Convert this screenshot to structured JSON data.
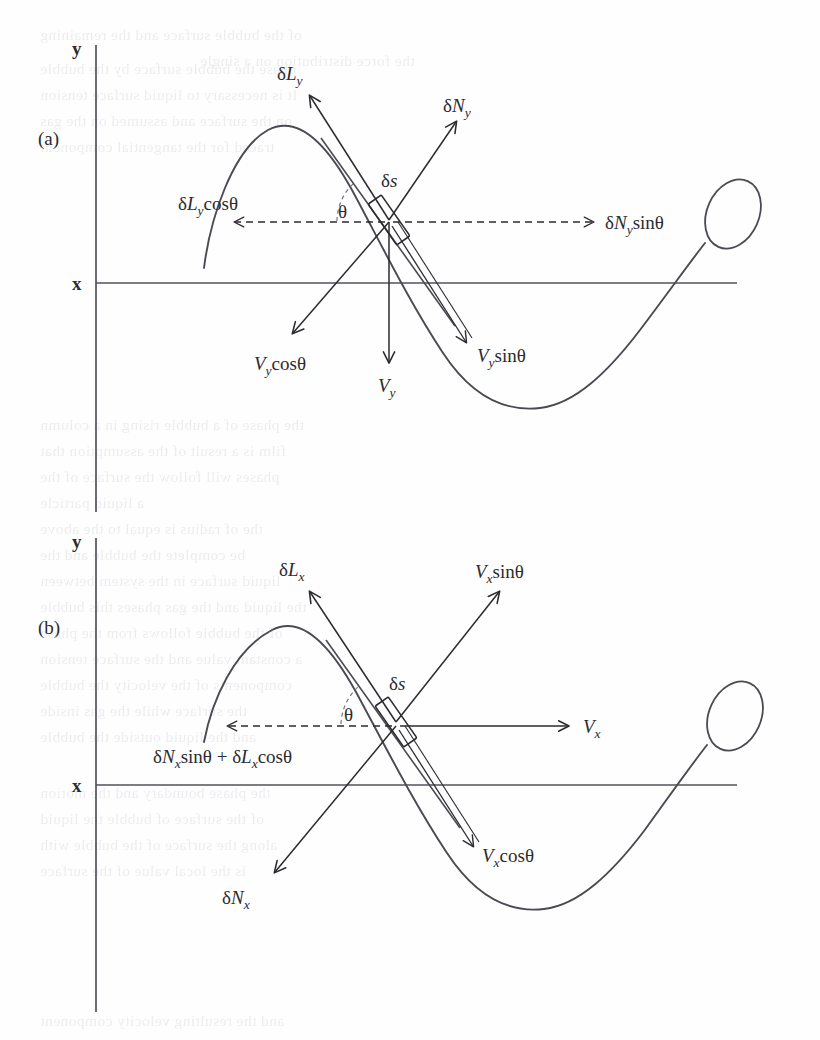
{
  "figure": {
    "type": "physics-force-diagram",
    "panels": [
      {
        "id": "a",
        "panel_label": "(a)",
        "axis_y_label": "y",
        "axis_x_label": "x",
        "element_label": "δs",
        "angle_label": "θ",
        "labels": [
          {
            "key": "deltaL",
            "text": "δL",
            "sub": "y",
            "suffix": "",
            "full": "δLᵧ"
          },
          {
            "key": "deltaN",
            "text": "δN",
            "sub": "y",
            "suffix": "",
            "full": "δNᵧ"
          },
          {
            "key": "deltaLcos",
            "text": "δL",
            "sub": "y",
            "suffix": "cosθ",
            "full": "δLᵧcosθ"
          },
          {
            "key": "deltaNsin",
            "text": "δN",
            "sub": "y",
            "suffix": "sinθ",
            "full": "δNᵧsinθ"
          },
          {
            "key": "Vcos",
            "text": "V",
            "sub": "y",
            "suffix": "cosθ",
            "full": "Vᵧcosθ"
          },
          {
            "key": "V",
            "text": "V",
            "sub": "y",
            "suffix": "",
            "full": "Vᵧ"
          },
          {
            "key": "Vsin",
            "text": "V",
            "sub": "y",
            "suffix": "sinθ",
            "full": "Vᵧsinθ"
          }
        ]
      },
      {
        "id": "b",
        "panel_label": "(b)",
        "axis_y_label": "y",
        "axis_x_label": "x",
        "element_label": "δs",
        "angle_label": "θ",
        "labels": [
          {
            "key": "deltaL",
            "text": "δL",
            "sub": "x",
            "suffix": "",
            "full": "δLₓ"
          },
          {
            "key": "Vsin",
            "text": "V",
            "sub": "x",
            "suffix": "sinθ",
            "full": "Vₓsinθ"
          },
          {
            "key": "combined",
            "text": "δN",
            "sub": "x",
            "suffix": "sinθ + δLₓcosθ",
            "full": "δNₓsinθ + δLₓcosθ"
          },
          {
            "key": "V",
            "text": "V",
            "sub": "x",
            "suffix": "",
            "full": "Vₓ"
          },
          {
            "key": "deltaN",
            "text": "δN",
            "sub": "x",
            "suffix": "",
            "full": "δNₓ"
          },
          {
            "key": "Vcos",
            "text": "V",
            "sub": "x",
            "suffix": "cosθ",
            "full": "Vₓcosθ"
          }
        ]
      }
    ],
    "colors": {
      "ink": "#2b2b30",
      "curve": "#4a4a52",
      "axis": "#52525a",
      "background": "#fefefe"
    }
  },
  "ghost_text": {
    "note": "faint bleed-through text from reverse side of printed page",
    "lines": [
      {
        "x": 40,
        "y": 22,
        "text": "of the bubble surface and the remaining"
      },
      {
        "x": 200,
        "y": 48,
        "text": "the force distribution on a single"
      },
      {
        "x": 40,
        "y": 56,
        "text": "phase the bubble surface by the bubble"
      },
      {
        "x": 40,
        "y": 82,
        "text": "It is necessary to liquid surface tension"
      },
      {
        "x": 40,
        "y": 108,
        "text": "on the surface and assumed on the gas"
      },
      {
        "x": 40,
        "y": 134,
        "text": "traced for the tangential component"
      },
      {
        "x": 40,
        "y": 412,
        "text": "the phase of a bubble rising in a column"
      },
      {
        "x": 40,
        "y": 438,
        "text": "film is a result of the assumption that"
      },
      {
        "x": 40,
        "y": 464,
        "text": "phases will follow the surface of the"
      },
      {
        "x": 40,
        "y": 490,
        "text": "a liquid particle"
      },
      {
        "x": 40,
        "y": 516,
        "text": "the of radius is equal to the above"
      },
      {
        "x": 40,
        "y": 542,
        "text": "be complete the bubble and the"
      },
      {
        "x": 40,
        "y": 568,
        "text": "liquid surface in the system between"
      },
      {
        "x": 40,
        "y": 594,
        "text": "the liquid and the gas phases this bubble"
      },
      {
        "x": 40,
        "y": 620,
        "text": "of the bubble follows from the phase"
      },
      {
        "x": 40,
        "y": 646,
        "text": "a constant value and the surface tension"
      },
      {
        "x": 40,
        "y": 672,
        "text": "components of the velocity the bubble"
      },
      {
        "x": 40,
        "y": 698,
        "text": "the surface while the gas inside"
      },
      {
        "x": 40,
        "y": 724,
        "text": "and the liquid outside the bubble"
      },
      {
        "x": 40,
        "y": 780,
        "text": "the phase boundary and the motion"
      },
      {
        "x": 40,
        "y": 806,
        "text": "of the surface of bubble the liquid"
      },
      {
        "x": 40,
        "y": 832,
        "text": "along the surface of the bubble with"
      },
      {
        "x": 40,
        "y": 858,
        "text": "is the local value of the surface"
      },
      {
        "x": 40,
        "y": 1008,
        "text": "and the resulting velocity component"
      }
    ]
  }
}
